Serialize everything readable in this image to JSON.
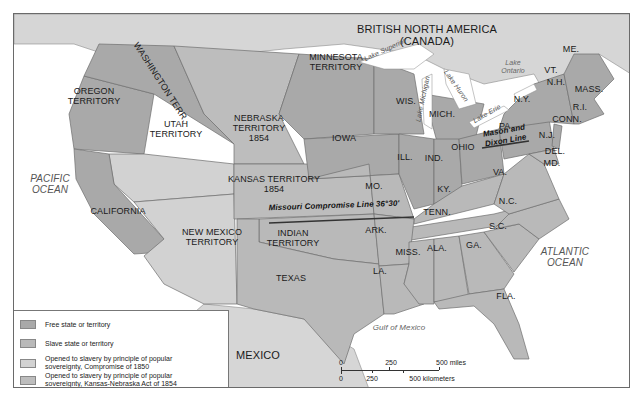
{
  "map": {
    "title": "United States after the Kansas-Nebraska Act of 1854",
    "colors": {
      "free": "#a9a9a9",
      "slave": "#b9b9b9",
      "popular_1850": "#d2d2d2",
      "popular_1854": "#bdbdbd",
      "foreign": "#d6d6d6",
      "water": "#ffffff",
      "border": "#6f6f6f"
    },
    "regions": {
      "canada": "BRITISH NORTH AMERICA\n(CANADA)",
      "mexico": "MEXICO",
      "oregon": "OREGON\nTERRITORY",
      "washington": "WASHINGTON TERR.",
      "nebraska": "NEBRASKA\nTERRITORY\n1854",
      "minnesota": "MINNESOTA\nTERRITORY",
      "utah": "UTAH\nTERRITORY",
      "kansas": "KANSAS TERRITORY\n1854",
      "california": "CALIFORNIA",
      "new_mexico": "NEW MEXICO\nTERRITORY",
      "indian": "INDIAN\nTERRITORY",
      "texas": "TEXAS",
      "iowa": "IOWA",
      "wis": "WIS.",
      "mich": "MICH.",
      "ill": "ILL.",
      "ind": "IND.",
      "ohio": "OHIO",
      "mo": "MO.",
      "ky": "KY.",
      "tenn": "TENN.",
      "ark": "ARK.",
      "la": "LA.",
      "miss": "MISS.",
      "ala": "ALA.",
      "ga": "GA.",
      "fla": "FLA.",
      "sc": "S.C.",
      "nc": "N.C.",
      "va": "VA.",
      "pa": "PA.",
      "ny": "N.Y.",
      "nj": "N.J.",
      "del": "DEL.",
      "md": "MD.",
      "conn": "CONN.",
      "ri": "R.I.",
      "mass": "MASS.",
      "nh": "N.H.",
      "vt": "VT.",
      "me": "ME."
    },
    "water": {
      "pacific": "PACIFIC\nOCEAN",
      "atlantic": "ATLANTIC\nOCEAN",
      "gulf": "Gulf of Mexico",
      "superior": "Lake Superior",
      "michigan": "Lake Michigan",
      "huron": "Lake Huron",
      "erie": "Lake Erie",
      "ontario": "Lake\nOntario"
    },
    "lines": {
      "missouri_compromise": "Missouri Compromise Line 36°30'",
      "mason_dixon": "Mason and\nDixon Line"
    }
  },
  "legend": {
    "items": [
      {
        "label": "Free state or territory",
        "color": "#a9a9a9"
      },
      {
        "label": "Slave state or territory",
        "color": "#b9b9b9"
      },
      {
        "label": "Opened to slavery by principle of popular\nsovereignty, Compromise of 1850",
        "color": "#d2d2d2"
      },
      {
        "label": "Opened to slavery by principle of popular\nsovereignty, Kansas-Nebraska Act of 1854",
        "color": "#bdbdbd"
      }
    ]
  },
  "scale": {
    "miles": [
      "0",
      "250",
      "500 miles"
    ],
    "km": [
      "0",
      "250",
      "500 kilometers"
    ]
  }
}
